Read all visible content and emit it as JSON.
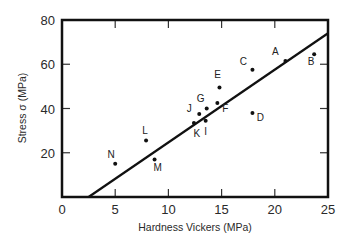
{
  "chart_data": {
    "type": "scatter",
    "title": "",
    "xlabel": "Hardness Vickers (MPa)",
    "ylabel": "Stress σ (MPa)",
    "xlim": [
      0,
      25
    ],
    "ylim": [
      0,
      80
    ],
    "x_ticks": [
      0,
      5,
      10,
      15,
      20,
      25
    ],
    "y_ticks": [
      20,
      40,
      60,
      80
    ],
    "x_tick_labels": [
      "0",
      "5",
      "10",
      "15",
      "20",
      "25"
    ],
    "y_tick_labels": [
      "20",
      "40",
      "60",
      "80"
    ],
    "grid": false,
    "legend": null,
    "points": [
      {
        "label": "A",
        "x": 21.0,
        "y": 61.5
      },
      {
        "label": "B",
        "x": 23.7,
        "y": 64.5
      },
      {
        "label": "C",
        "x": 17.9,
        "y": 57.5
      },
      {
        "label": "D",
        "x": 17.9,
        "y": 38.0
      },
      {
        "label": "E",
        "x": 14.8,
        "y": 49.5
      },
      {
        "label": "F",
        "x": 14.6,
        "y": 42.5
      },
      {
        "label": "G",
        "x": 13.6,
        "y": 40.0
      },
      {
        "label": "I",
        "x": 13.5,
        "y": 34.5
      },
      {
        "label": "J",
        "x": 12.9,
        "y": 37.5
      },
      {
        "label": "K",
        "x": 12.4,
        "y": 33.5
      },
      {
        "label": "L",
        "x": 7.9,
        "y": 25.5
      },
      {
        "label": "M",
        "x": 8.7,
        "y": 17.0
      },
      {
        "label": "N",
        "x": 5.0,
        "y": 15.0
      }
    ],
    "fit_line": {
      "x": [
        2.5,
        25
      ],
      "y": [
        0,
        74
      ]
    }
  }
}
